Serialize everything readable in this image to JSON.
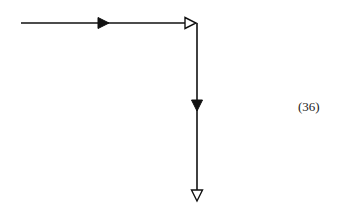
{
  "diagram": {
    "equation_label": "(36)",
    "stroke_color": "#111111",
    "edges": [
      {
        "name": "horizontal-edge",
        "from": [
          21,
          23
        ],
        "to": [
          197,
          23
        ],
        "arrows": [
          {
            "type": "filled",
            "at": [
              103,
              23
            ],
            "dir": "right"
          },
          {
            "type": "hollow",
            "at": [
              190,
              23
            ],
            "dir": "right"
          }
        ]
      },
      {
        "name": "vertical-edge",
        "from": [
          197,
          23
        ],
        "to": [
          197,
          202
        ],
        "arrows": [
          {
            "type": "filled",
            "at": [
              197,
              105
            ],
            "dir": "down"
          },
          {
            "type": "hollow",
            "at": [
              197,
              195
            ],
            "dir": "down"
          }
        ]
      }
    ]
  }
}
